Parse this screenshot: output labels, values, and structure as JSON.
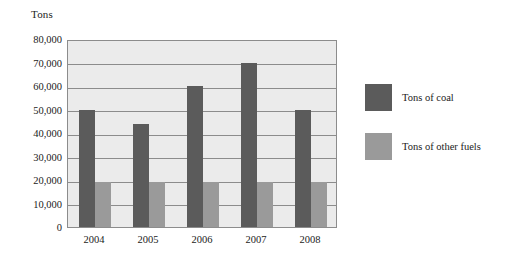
{
  "chart_data": {
    "type": "bar",
    "title": "",
    "subtitle": "",
    "xlabel": "",
    "ylabel": "Tons",
    "categories": [
      "2004",
      "2005",
      "2006",
      "2007",
      "2008"
    ],
    "series": [
      {
        "name": "Tons of coal",
        "color": "#5b5b5b",
        "values": [
          50000,
          44000,
          60000,
          70000,
          50000
        ]
      },
      {
        "name": "Tons of other fuels",
        "color": "#9a9a9a",
        "values": [
          19000,
          19000,
          19000,
          19000,
          19000
        ]
      }
    ],
    "ylim": [
      0,
      80000
    ],
    "ytick_labels": [
      "80,000",
      "70,000",
      "60,000",
      "50,000",
      "40,000",
      "30,000",
      "20,000",
      "10,000",
      "0"
    ],
    "ytick_values": [
      80000,
      70000,
      60000,
      50000,
      40000,
      30000,
      20000,
      10000,
      0
    ],
    "grid": true,
    "grid_axis": "y",
    "legend_position": "right",
    "plot_background": "#ebebeb",
    "axis_color": "#8c8c8c",
    "bar_grouping": "grouped-adjacent"
  }
}
